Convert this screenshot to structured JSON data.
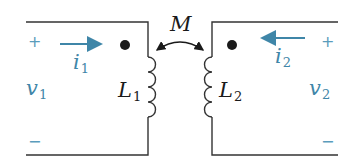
{
  "diagram": {
    "type": "coupled-inductors",
    "colors": {
      "wire": "#333333",
      "accent": "#3f86a8",
      "dot": "#1a1a1a"
    },
    "mutual": {
      "label": "M"
    },
    "left": {
      "voltage": {
        "name": "v",
        "sub": "1",
        "plus": "+",
        "minus": "−"
      },
      "current": {
        "name": "i",
        "sub": "1",
        "direction": "right"
      },
      "inductor": {
        "name": "L",
        "sub": "1"
      },
      "dot": "dot-marker"
    },
    "right": {
      "voltage": {
        "name": "v",
        "sub": "2",
        "plus": "+",
        "minus": "−"
      },
      "current": {
        "name": "i",
        "sub": "2",
        "direction": "left"
      },
      "inductor": {
        "name": "L",
        "sub": "2"
      },
      "dot": "dot-marker"
    }
  }
}
